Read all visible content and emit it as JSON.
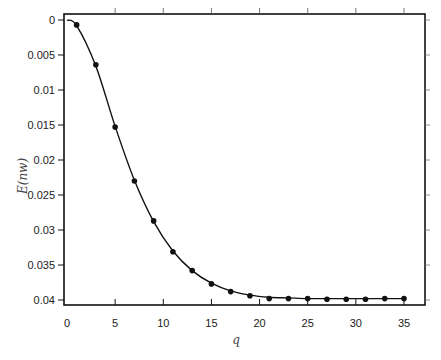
{
  "chart_data": {
    "type": "line",
    "title": "",
    "xlabel": "q",
    "ylabel": "E(nw)",
    "xlim": [
      0,
      37
    ],
    "ylim": [
      0,
      0.0415
    ],
    "y_inverted": true,
    "grid": false,
    "legend": null,
    "x_ticks": [
      0,
      5,
      10,
      15,
      20,
      25,
      30,
      35
    ],
    "x_tick_labels": [
      "0",
      "5",
      "10",
      "15",
      "20",
      "25",
      "30",
      "35"
    ],
    "y_ticks": [
      0,
      0.005,
      0.01,
      0.015,
      0.02,
      0.025,
      0.03,
      0.035,
      0.04
    ],
    "y_tick_labels": [
      "0",
      "0.005",
      "0.01",
      "0.015",
      "0.02",
      "0.025",
      "0.03",
      "0.035",
      "0.04"
    ],
    "series": [
      {
        "name": "simulated",
        "style": "markers",
        "x": [
          1,
          3,
          5,
          7,
          9,
          11,
          13,
          15,
          17,
          19,
          21,
          23,
          25,
          27,
          29,
          31,
          33,
          35
        ],
        "y": [
          0.0007,
          0.0064,
          0.0153,
          0.023,
          0.0287,
          0.0331,
          0.0358,
          0.0377,
          0.0388,
          0.0394,
          0.0398,
          0.0398,
          0.0398,
          0.0399,
          0.0399,
          0.0399,
          0.0398,
          0.0398
        ]
      },
      {
        "name": "analytic",
        "style": "line",
        "x": [
          0,
          1,
          3,
          5,
          7,
          9,
          11,
          13,
          15,
          17,
          19,
          21,
          23,
          25,
          27,
          29,
          31,
          33,
          35
        ],
        "y": [
          0.0,
          0.0008,
          0.0066,
          0.0152,
          0.0229,
          0.0288,
          0.033,
          0.0358,
          0.0376,
          0.0387,
          0.0393,
          0.0396,
          0.0397,
          0.0398,
          0.0398,
          0.0398,
          0.0398,
          0.0398,
          0.0398
        ]
      }
    ]
  }
}
